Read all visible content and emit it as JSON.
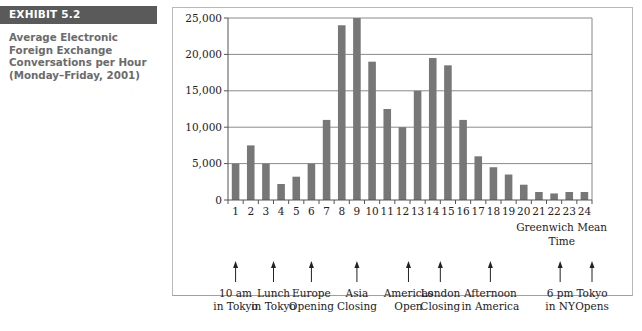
{
  "exhibit": {
    "label": "EXHIBIT 5.2",
    "title_lines": [
      "Average Electronic",
      "Foreign Exchange",
      "Conversations per Hour",
      "(Monday–Friday, 2001)"
    ]
  },
  "colors": {
    "bar": "#777777",
    "grid": "#8a8a8a",
    "banner": "#5a5a5a",
    "caption": "#6b6b6b"
  },
  "chart_data": {
    "type": "bar",
    "title": "Average Electronic Foreign Exchange Conversations per Hour (Monday–Friday, 2001)",
    "xlabel": "Greenwich Mean Time",
    "ylabel": "",
    "ylim": [
      0,
      25000
    ],
    "yticks": [
      0,
      5000,
      10000,
      15000,
      20000,
      25000
    ],
    "ytick_labels": [
      "0",
      "5,000",
      "10,000",
      "15,000",
      "20,000",
      "25,000"
    ],
    "grid": true,
    "legend": null,
    "categories": [
      "1",
      "2",
      "3",
      "4",
      "5",
      "6",
      "7",
      "8",
      "9",
      "10",
      "11",
      "12",
      "13",
      "14",
      "15",
      "16",
      "17",
      "18",
      "19",
      "20",
      "21",
      "22",
      "23",
      "24"
    ],
    "values": [
      5000,
      7500,
      5000,
      2200,
      3200,
      5000,
      11000,
      24000,
      25000,
      19000,
      12500,
      10000,
      15000,
      19500,
      18500,
      11000,
      6000,
      4500,
      3500,
      2100,
      1100,
      900,
      1100,
      1100
    ],
    "xlabel_lines": [
      "Greenwich Mean",
      "Time"
    ],
    "annotations": [
      {
        "hour": 1,
        "lines": [
          "10 am",
          "in Tokyo"
        ]
      },
      {
        "hour": 3.5,
        "lines": [
          "Lunch",
          "in Tokyo"
        ]
      },
      {
        "hour": 6,
        "lines": [
          "Europe",
          "Opening"
        ]
      },
      {
        "hour": 9,
        "lines": [
          "Asia",
          "Closing"
        ]
      },
      {
        "hour": 12.4,
        "lines": [
          "Americas",
          "Open"
        ]
      },
      {
        "hour": 14.5,
        "lines": [
          "London",
          "Closing"
        ]
      },
      {
        "hour": 17.8,
        "lines": [
          "Afternoon",
          "in America"
        ]
      },
      {
        "hour": 22.4,
        "lines": [
          "6 pm",
          "in NY"
        ]
      },
      {
        "hour": 24.5,
        "lines": [
          "Tokyo",
          "Opens"
        ]
      }
    ]
  }
}
